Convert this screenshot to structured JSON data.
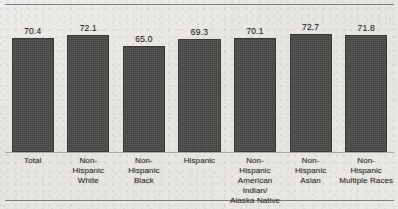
{
  "chart_data": {
    "type": "bar",
    "title": "",
    "xlabel": "",
    "ylabel": "",
    "ylim": [
      0,
      80
    ],
    "grid": false,
    "legend": "none",
    "categories": [
      "Total",
      "Non-Hispanic White",
      "Non-Hispanic Black",
      "Hispanic",
      "Non-Hispanic American Indian/ Alaska Native",
      "Non-Hispanic Asian",
      "Non-Hispanic Multiple Races"
    ],
    "values": [
      70.4,
      72.1,
      65.0,
      69.3,
      70.1,
      72.7,
      71.8
    ],
    "bar_color": "#4b4a48"
  },
  "chart": {
    "bars": [
      {
        "value_label": "70.4",
        "value": 70.4,
        "category_lines": [
          "Total"
        ]
      },
      {
        "value_label": "72.1",
        "value": 72.1,
        "category_lines": [
          "Non-",
          "Hispanic",
          "White"
        ]
      },
      {
        "value_label": "65.0",
        "value": 65.0,
        "category_lines": [
          "Non-",
          "Hispanic",
          "Black"
        ]
      },
      {
        "value_label": "69.3",
        "value": 69.3,
        "category_lines": [
          "Hispanic"
        ]
      },
      {
        "value_label": "70.1",
        "value": 70.1,
        "category_lines": [
          "Non-",
          "Hispanic",
          "American Indian/",
          "Alaska Native"
        ]
      },
      {
        "value_label": "72.7",
        "value": 72.7,
        "category_lines": [
          "Non-",
          "Hispanic",
          "Asian"
        ]
      },
      {
        "value_label": "71.8",
        "value": 71.8,
        "category_lines": [
          "Non-",
          "Hispanic",
          "Multiple Races"
        ]
      }
    ]
  }
}
